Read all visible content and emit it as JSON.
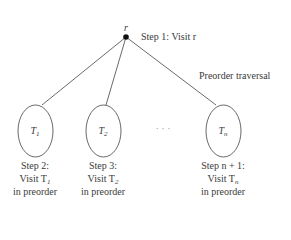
{
  "diagram": {
    "type": "tree",
    "title": "Preorder traversal",
    "root": {
      "label": "r",
      "step": "Step 1: Visit r"
    },
    "subtrees": [
      {
        "label": "T",
        "sub": "1",
        "step": "Step 2:",
        "visit": "Visit T",
        "visit_sub": "1",
        "mode": "in preorder"
      },
      {
        "label": "T",
        "sub": "2",
        "step": "Step 3:",
        "visit": "Visit T",
        "visit_sub": "2",
        "mode": "in preorder"
      },
      {
        "label": "T",
        "sub": "n",
        "step": "Step n + 1:",
        "visit": "Visit T",
        "visit_sub": "n",
        "mode": "in preorder"
      }
    ],
    "ellipsis": "· · ·"
  }
}
